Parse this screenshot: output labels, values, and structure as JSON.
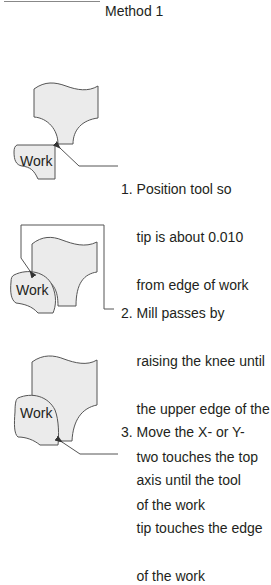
{
  "title": "Method 1",
  "colors": {
    "shape_fill": "#ebebeb",
    "outline": "#555555",
    "text": "#231f20"
  },
  "figures": [
    {
      "work_label": "Work",
      "step_lines": [
        "1. Position tool so",
        "    tip is about 0.010",
        "    from edge of work"
      ]
    },
    {
      "work_label": "Work",
      "step_lines": [
        "2. Mill passes by",
        "    raising the knee until",
        "    the upper edge of the",
        "    two touches the top",
        "    of the work"
      ]
    },
    {
      "work_label": "Work",
      "step_lines": [
        "3. Move the X- or Y-",
        "    axis until the tool",
        "    tip touches the edge",
        "    of the work"
      ]
    }
  ]
}
